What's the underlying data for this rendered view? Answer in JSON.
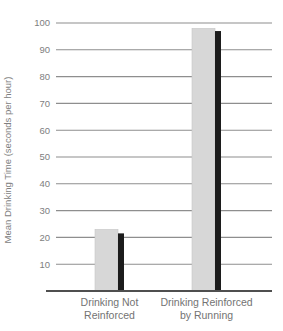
{
  "chart_data": {
    "type": "bar",
    "title": "",
    "xlabel": "",
    "ylabel": "Mean Drinking Time (seconds per hour)",
    "categories": [
      [
        "Drinking Not",
        "Reinforced"
      ],
      [
        "Drinking Reinforced",
        "by Running"
      ]
    ],
    "values": [
      23,
      98
    ],
    "shadow_values": [
      21.5,
      97
    ],
    "yticks": [
      10,
      20,
      30,
      40,
      50,
      60,
      70,
      80,
      90,
      100
    ],
    "ylim": [
      0,
      100
    ],
    "grid": "on",
    "legend": "none",
    "colors": {
      "bar": "#d7d7d7",
      "bar_edge": "#c6c6c6",
      "bar_shadow": "#1c1c1c",
      "gridline": "#8e8e8e",
      "axis": "#4f4f4f",
      "tick_text": "#7e7e7e",
      "label_text": "#737373",
      "background": "#ffffff"
    },
    "layout": {
      "width": 283,
      "height": 331,
      "top_y": 23,
      "baseline_y": 291,
      "grid_x1": 56,
      "grid_x2": 272,
      "axis_x1": 46,
      "axis_x2": 272,
      "tick_label_x": 50,
      "tick_font_size": 9.5,
      "bar_centers_x": [
        109.5,
        206.5
      ],
      "bar_width": 23,
      "shadow_width": 6,
      "label_y": 306,
      "label_line_h": 13,
      "label_font_size": 10.5,
      "ytitle_x": 11,
      "ytitle_y": 160,
      "ytitle_font_size": 9.5
    }
  }
}
